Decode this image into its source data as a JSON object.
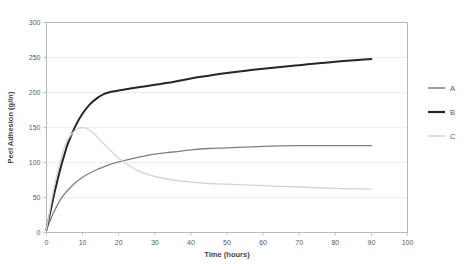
{
  "chart_data": {
    "type": "line",
    "title": "",
    "xlabel": "Time (hours)",
    "ylabel": "Peel Adhesion (g/in)",
    "xlim": [
      0,
      100
    ],
    "ylim": [
      0,
      300
    ],
    "xticks": [
      0,
      10,
      20,
      30,
      40,
      50,
      60,
      70,
      80,
      90,
      100
    ],
    "yticks": [
      0,
      50,
      100,
      150,
      200,
      250,
      300
    ],
    "xtick_labels": [
      "0",
      "10",
      "20",
      "30",
      "40",
      "50",
      "60",
      "70",
      "80",
      "90",
      "100"
    ],
    "ytick_labels": [
      "0",
      "50",
      "100",
      "150",
      "200",
      "250",
      "300"
    ],
    "grid": "horizontal",
    "legend_position": "right",
    "x": [
      0,
      1,
      2,
      3,
      4,
      5,
      6,
      8,
      10,
      12,
      14,
      16,
      18,
      20,
      25,
      30,
      35,
      40,
      45,
      50,
      60,
      70,
      80,
      90
    ],
    "series": [
      {
        "name": "A",
        "color": "#808080",
        "width": 1.3,
        "values": [
          4,
          17,
          29,
          39,
          48,
          55,
          61,
          71,
          79,
          85,
          90,
          94,
          98,
          101,
          107,
          112,
          115,
          118,
          120,
          121,
          123,
          124,
          124,
          124
        ]
      },
      {
        "name": "B",
        "color": "#262626",
        "width": 2.0,
        "values": [
          4,
          28,
          52,
          74,
          94,
          112,
          128,
          152,
          170,
          183,
          192,
          198,
          201,
          203,
          207,
          211,
          215,
          220,
          224,
          228,
          234,
          239,
          244,
          248
        ]
      },
      {
        "name": "C",
        "color": "#d4d4d4",
        "width": 1.3,
        "values": [
          4,
          34,
          62,
          86,
          106,
          122,
          134,
          146,
          150,
          146,
          137,
          126,
          116,
          106,
          89,
          80,
          75,
          72,
          70,
          69,
          67,
          65,
          63,
          62
        ]
      }
    ],
    "legend": [
      {
        "label": "A",
        "color": "#808080",
        "width": 1.5
      },
      {
        "label": "B",
        "color": "#262626",
        "width": 2.2
      },
      {
        "label": "C",
        "color": "#d4d4d4",
        "width": 1.5
      }
    ]
  }
}
